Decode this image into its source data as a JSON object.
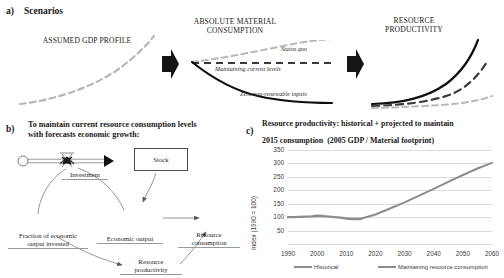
{
  "figure": {
    "panel_a": {
      "letter": "a)",
      "title": "Scenarios",
      "captions": {
        "gdp": "ASSUMED GDP PROFILE",
        "material": "ABSOLUTE MATERIAL CONSUMPTION",
        "productivity": "RESOURCE PRODUCTIVITY"
      },
      "curve_labels": {
        "status_quo": "Status quo",
        "maintaining": "Maintaining current levels",
        "zero_inputs": "Zero non-renewable inputs"
      },
      "arrow_icon": "right-arrow-icon"
    },
    "panel_b": {
      "letter": "b)",
      "title_line1": "To maintain current resource consumption levels",
      "title_line2": "with forecasts economic growth:",
      "nodes": {
        "stock": "Stock",
        "investment": "Investment",
        "fraction": "Fraction of economic output invested",
        "fraction_line1": "Fraction of economic",
        "fraction_line2": "output invested",
        "economic_output": "Economic output",
        "resource_consumption_line1": "Resource",
        "resource_consumption_line2": "consumption",
        "resource_productivity_line1": "Resource",
        "resource_productivity_line2": "productivity"
      }
    },
    "panel_c": {
      "letter": "c)",
      "title_bold_line1": "Resource productivity: historical + projected to maintain",
      "title_bold_line2": "2015 consumption",
      "title_light": "(2005 GDP / Material footprint)"
    }
  },
  "chart_data": {
    "type": "line",
    "xlabel": "",
    "ylabel": "Index (1990 = 100)",
    "xlim": [
      1990,
      2060
    ],
    "ylim": [
      0,
      350
    ],
    "grid": true,
    "legend_position": "bottom",
    "yticks": [
      50,
      100,
      150,
      200,
      250,
      300,
      350
    ],
    "xticks": [
      1990,
      2000,
      2010,
      2020,
      2030,
      2040,
      2050,
      2060
    ],
    "series": [
      {
        "name": "Historical",
        "color": "#8c8c8c",
        "x": [
          1990,
          1992,
          1994,
          1996,
          1998,
          2000,
          2002,
          2004,
          2006,
          2008,
          2010,
          2012,
          2014,
          2015
        ],
        "values": [
          100,
          100,
          101,
          102,
          103,
          105,
          104,
          102,
          100,
          98,
          95,
          93,
          93,
          94
        ]
      },
      {
        "name": "Maintaining resource consumption",
        "color": "#8c8c8c",
        "x": [
          2015,
          2020,
          2025,
          2030,
          2035,
          2040,
          2045,
          2050,
          2055,
          2060
        ],
        "values": [
          94,
          110,
          132,
          155,
          180,
          205,
          231,
          257,
          281,
          302
        ]
      }
    ]
  }
}
